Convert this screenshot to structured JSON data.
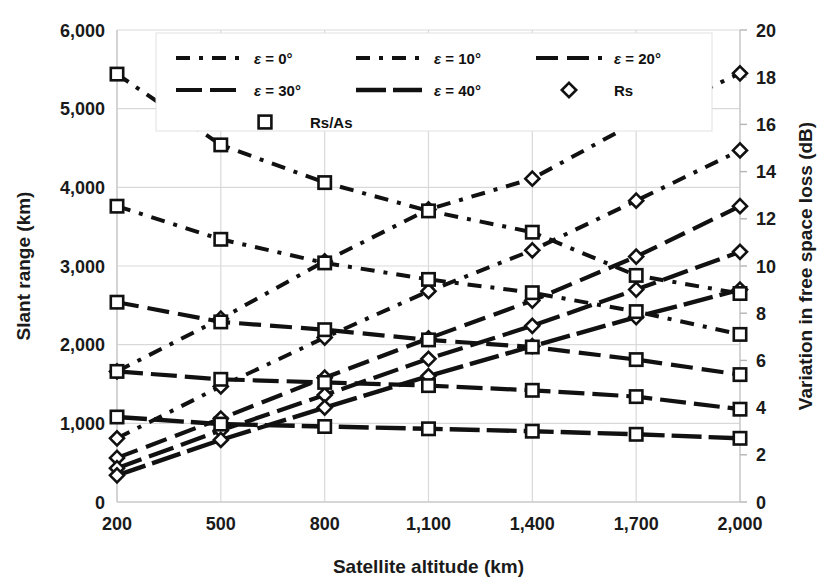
{
  "chart_data": {
    "type": "line",
    "title": "",
    "xlabel": "Satellite altitude (km)",
    "ylabel": "Slant range (km)",
    "y2label": "Variation in free space loss (dB)",
    "x": [
      200,
      500,
      800,
      1100,
      1400,
      1700,
      2000
    ],
    "xticks": [
      "200",
      "500",
      "800",
      "1,100",
      "1,400",
      "1,700",
      "2,000"
    ],
    "xlim": [
      200,
      2000
    ],
    "yticks": [
      "0",
      "1,000",
      "2,000",
      "3,000",
      "4,000",
      "5,000",
      "6,000"
    ],
    "ytickvals": [
      0,
      1000,
      2000,
      3000,
      4000,
      5000,
      6000
    ],
    "ylim": [
      0,
      6000
    ],
    "y2ticks": [
      "0",
      "2",
      "4",
      "6",
      "8",
      "10",
      "12",
      "14",
      "16",
      "18",
      "20"
    ],
    "y2tickvals": [
      0,
      2,
      4,
      6,
      8,
      10,
      12,
      14,
      16,
      18,
      20
    ],
    "y2lim": [
      0,
      20
    ],
    "grid": true,
    "legend_position": "top-center",
    "series": [
      {
        "name": "Rs, ε = 0°",
        "marker": "diamond",
        "axis": "left",
        "dash": "14,9,4,9",
        "width": 4.0,
        "values": [
          1660,
          2330,
          3060,
          3720,
          4110,
          4830,
          5450
        ]
      },
      {
        "name": "Rs, ε = 10°",
        "marker": "diamond",
        "axis": "left",
        "dash": "14,9,4,9",
        "width": 4.0,
        "values": [
          810,
          1470,
          2090,
          2680,
          3200,
          3830,
          4470
        ]
      },
      {
        "name": "Rs, ε = 20°",
        "marker": "diamond",
        "axis": "left",
        "dash": "22,9",
        "width": 4.2,
        "values": [
          560,
          1060,
          1580,
          2080,
          2560,
          3120,
          3760
        ]
      },
      {
        "name": "Rs, ε = 30°",
        "marker": "diamond",
        "axis": "left",
        "dash": "26,8",
        "width": 4.2,
        "values": [
          430,
          910,
          1360,
          1820,
          2240,
          2700,
          3180
        ]
      },
      {
        "name": "Rs, ε = 40°",
        "marker": "diamond",
        "axis": "left",
        "dash": "30,7",
        "width": 4.4,
        "values": [
          340,
          790,
          1200,
          1600,
          1980,
          2350,
          2700
        ]
      },
      {
        "name": "Rs/As, ε = 0°",
        "marker": "square",
        "axis": "right",
        "dash": "14,9,4,9",
        "width": 4.0,
        "values": [
          5440,
          4540,
          4060,
          3700,
          3430,
          2880,
          2650
        ]
      },
      {
        "name": "Rs/As, ε = 10°",
        "marker": "square",
        "axis": "right",
        "dash": "14,9,4,9",
        "width": 4.0,
        "values": [
          3760,
          3340,
          3040,
          2830,
          2660,
          2420,
          2130
        ]
      },
      {
        "name": "Rs/As, ε = 20°",
        "marker": "square",
        "axis": "right",
        "dash": "22,9",
        "width": 4.2,
        "values": [
          2540,
          2290,
          2190,
          2060,
          1970,
          1810,
          1620
        ]
      },
      {
        "name": "Rs/As, ε = 30°",
        "marker": "square",
        "axis": "right",
        "dash": "26,8",
        "width": 4.2,
        "values": [
          1660,
          1560,
          1520,
          1480,
          1420,
          1340,
          1180
        ]
      },
      {
        "name": "Rs/As, ε = 40°",
        "marker": "square",
        "axis": "right",
        "dash": "30,7",
        "width": 4.4,
        "values": [
          1080,
          990,
          960,
          930,
          900,
          860,
          810
        ]
      }
    ]
  },
  "legend": {
    "rows": [
      [
        {
          "label": "ε = 0°",
          "type": "line",
          "dash": "14,9,4,9",
          "width": 4.0,
          "name": "legend-eps-0"
        },
        {
          "label": "ε = 10°",
          "type": "line",
          "dash": "14,9,4,9",
          "width": 4.0,
          "name": "legend-eps-10"
        },
        {
          "label": "ε = 20°",
          "type": "line",
          "dash": "22,9",
          "width": 4.2,
          "name": "legend-eps-20"
        }
      ],
      [
        {
          "label": "ε = 30°",
          "type": "line",
          "dash": "26,8",
          "width": 4.2,
          "name": "legend-eps-30"
        },
        {
          "label": "ε = 40°",
          "type": "line",
          "dash": "30,7",
          "width": 4.4,
          "name": "legend-eps-40"
        },
        {
          "label": "Rs",
          "type": "diamond",
          "name": "legend-rs"
        }
      ],
      [
        {
          "label": "Rs/As",
          "type": "square",
          "name": "legend-rs-as"
        }
      ]
    ]
  },
  "colors": {
    "ink": "#111111",
    "grid": "#d9d9d9",
    "axis": "#cfcfcf",
    "background": "#ffffff"
  },
  "geometry": {
    "plot_left": 117,
    "plot_right": 740,
    "plot_top": 30,
    "plot_bottom": 502
  }
}
